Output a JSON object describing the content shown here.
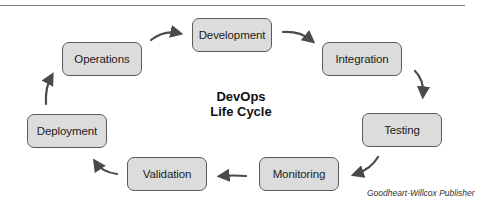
{
  "diagram": {
    "title_line1": "DevOps",
    "title_line2": "Life Cycle",
    "credit": "Goodheart-Willcox Publisher",
    "stages": [
      {
        "label": "Development"
      },
      {
        "label": "Integration"
      },
      {
        "label": "Testing"
      },
      {
        "label": "Monitoring"
      },
      {
        "label": "Validation"
      },
      {
        "label": "Deployment"
      },
      {
        "label": "Operations"
      }
    ],
    "flow": "Development → Integration → Testing → Monitoring → Validation → Deployment → Operations → Development",
    "colors": {
      "box_fill": "#dcdcdc",
      "box_border": "#5a5a5a",
      "arrow": "#4a4a4a",
      "rule": "#7a7a7a"
    }
  }
}
